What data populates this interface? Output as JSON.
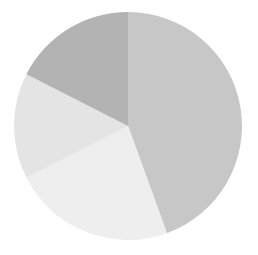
{
  "chart_data": {
    "type": "pie",
    "title": "",
    "subtitle": "",
    "xlabel": "",
    "ylabel": "",
    "grid": false,
    "legend": false,
    "legend_position": "none",
    "start_angle_deg": 0,
    "direction": "clockwise",
    "center": {
      "cx": 128,
      "cy": 126
    },
    "radius": 114,
    "categories": [
      "Slice 1",
      "Slice 2",
      "Slice 3",
      "Slice 4"
    ],
    "values": [
      44.4,
      23.1,
      15.0,
      17.5
    ],
    "percentages": [
      "44.4%",
      "23.1%",
      "15.0%",
      "17.5%"
    ],
    "angles_deg": [
      160,
      83,
      54,
      63
    ],
    "colors": [
      "#c7c7c7",
      "#eeeeee",
      "#e4e4e4",
      "#b3b3b3"
    ],
    "slices": [
      {
        "label": "Slice 1",
        "value": 44.4,
        "percent": "44.4%",
        "color": "#c7c7c7",
        "start_deg": 0,
        "end_deg": 160
      },
      {
        "label": "Slice 2",
        "value": 23.1,
        "percent": "23.1%",
        "color": "#eeeeee",
        "start_deg": 160,
        "end_deg": 243
      },
      {
        "label": "Slice 3",
        "value": 15.0,
        "percent": "15.0%",
        "color": "#e4e4e4",
        "start_deg": 243,
        "end_deg": 297
      },
      {
        "label": "Slice 4",
        "value": 17.5,
        "percent": "17.5%",
        "color": "#b3b3b3",
        "start_deg": 297,
        "end_deg": 360
      }
    ],
    "background_color": "#ffffff"
  }
}
